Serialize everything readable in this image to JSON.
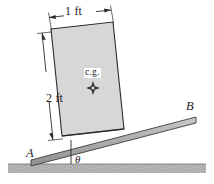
{
  "figure": {
    "type": "statics-free-body-diagram",
    "width": 214,
    "height": 184,
    "background_color": "#ffffff"
  },
  "labels": {
    "width_dimension": "1 ft",
    "height_dimension": "2 ft",
    "center_of_gravity": "c.g.",
    "point_a": "A",
    "point_b": "B",
    "angle": "θ"
  },
  "colors": {
    "block_fill": "#d7d7d7",
    "block_stroke": "#2b2b2b",
    "plank_fill": "#b4b4b4",
    "plank_stroke": "#3a3a3a",
    "ground_fill": "#c6c6c6",
    "ground_stroke": "#8a8a8a",
    "line": "#2b2b2b",
    "text": "#1a1a1a"
  },
  "geometry": {
    "block": {
      "tilt_degrees": 5,
      "corners": [
        [
          51,
          29
        ],
        [
          113,
          22
        ],
        [
          124,
          129
        ],
        [
          62,
          136
        ]
      ]
    },
    "plank": {
      "incline_degrees": 13,
      "start_point": [
        31,
        160
      ],
      "end_point": [
        196,
        117
      ]
    },
    "ground": {
      "top_y": 164,
      "height": 10
    },
    "cg_marker": {
      "x": 93,
      "y": 88,
      "shape": "four-point-star"
    }
  },
  "annotations": {
    "width_dim_line": {
      "from": [
        49,
        17
      ],
      "to": [
        111,
        10
      ]
    },
    "height_dim_line": {
      "from": [
        42,
        33
      ],
      "to": [
        53,
        140
      ]
    },
    "angle_vertical_ref": {
      "from": [
        71,
        141
      ],
      "to": [
        71,
        164
      ]
    }
  }
}
